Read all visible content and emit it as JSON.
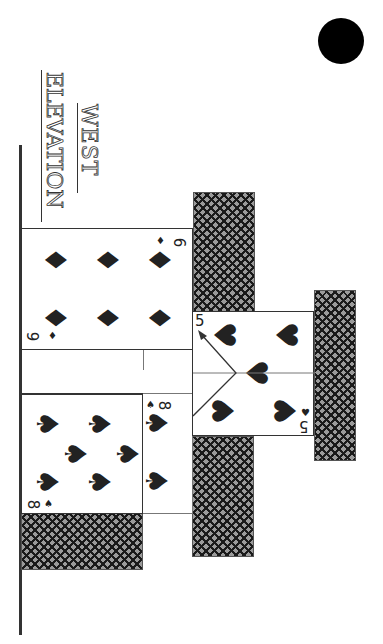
{
  "title": {
    "line1": "WEST",
    "line2": "ELEVATION"
  },
  "marker": {
    "icon": "filled-circle",
    "color": "#000000"
  },
  "cards": [
    {
      "name": "six-of-diamonds",
      "rank": "6",
      "suit": "diamonds",
      "suit_glyph": "♦",
      "pips": 6
    },
    {
      "name": "five-of-hearts",
      "rank": "5",
      "suit": "hearts",
      "suit_glyph": "♥",
      "pips": 5
    },
    {
      "name": "eight-of-spades",
      "rank": "8",
      "suit": "spades",
      "suit_glyph": "♠",
      "pips": 8
    }
  ],
  "card_backs": [
    {
      "name": "card-back-upper-middle"
    },
    {
      "name": "card-back-right"
    },
    {
      "name": "card-back-lower-middle"
    },
    {
      "name": "card-back-bottom-left"
    }
  ],
  "colors": {
    "ink": "#333333",
    "fill": "#1a1a1a",
    "paper": "#ffffff"
  }
}
